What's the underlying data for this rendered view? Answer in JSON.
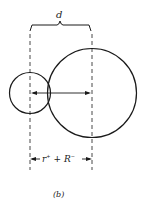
{
  "diagram": {
    "top_label": "d",
    "bottom_label_parts": {
      "r": "r",
      "r_sup": "+",
      "plus": "+",
      "R": "R",
      "R_sup": "−"
    },
    "caption": "(b)",
    "stroke_color": "#1a1a1a"
  }
}
